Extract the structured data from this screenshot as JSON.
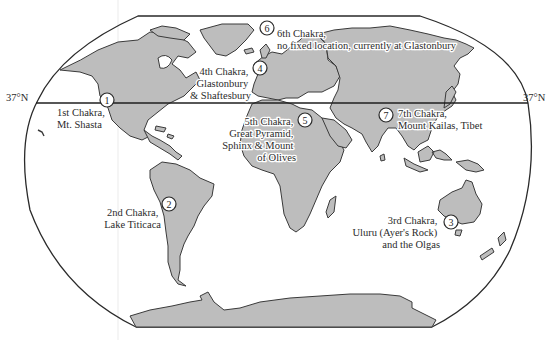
{
  "map": {
    "title": "World map of the seven Earth Chakras",
    "latitude_line": {
      "label_left": "37°N",
      "label_right": "37°N"
    },
    "colors": {
      "land": "#bdbdbd",
      "outline": "#3a3a3a",
      "ocean": "#ffffff",
      "text": "#2b2b2b"
    },
    "chakras": [
      {
        "number": "1",
        "lines": [
          "1st Chakra,",
          "Mt. Shasta"
        ]
      },
      {
        "number": "2",
        "lines": [
          "2nd Chakra,",
          "Lake Titicaca"
        ]
      },
      {
        "number": "3",
        "lines": [
          "3rd Chakra,",
          "Uluru (Ayer's Rock)",
          "and the Olgas"
        ]
      },
      {
        "number": "4",
        "lines": [
          "4th Chakra,",
          "Glastonbury",
          "& Shaftesbury"
        ]
      },
      {
        "number": "5",
        "lines": [
          "5th Chakra,",
          "Great Pyramid,",
          "Sphinx & Mount",
          "of Olives"
        ]
      },
      {
        "number": "6",
        "lines": [
          "6th Chakra,",
          "no fixed location, currently at Glastonbury"
        ]
      },
      {
        "number": "7",
        "lines": [
          "7th Chakra,",
          "Mount Kailas, Tibet"
        ]
      }
    ]
  }
}
